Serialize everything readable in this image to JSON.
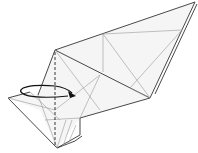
{
  "diagram": {
    "type": "origami-fold-step",
    "colors": {
      "background": "#ffffff",
      "paper_fill": "#f4f4f4",
      "edge": "#333333",
      "crease": "#9a9a9a",
      "fold_line": "#222222",
      "arrow": "#111111"
    },
    "elements": {
      "valley_fold_line": "dashed vertical fold line",
      "fold_arrow": "curved arrow indicating fold behind/over to the right"
    }
  }
}
